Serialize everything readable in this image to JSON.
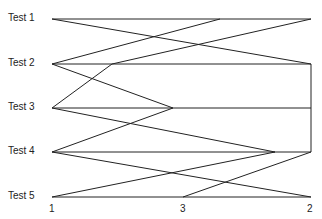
{
  "rows": [
    {
      "label": "Test 1",
      "y": 19
    },
    {
      "label": "Test 2",
      "y": 64
    },
    {
      "label": "Test 3",
      "y": 108
    },
    {
      "label": "Test 4",
      "y": 152
    },
    {
      "label": "Test 5",
      "y": 197
    }
  ],
  "columns": [
    {
      "label": "1",
      "x": 52
    },
    {
      "label": "3",
      "x": 183
    },
    {
      "label": "2",
      "x": 311
    }
  ],
  "line_color": "#222222"
}
